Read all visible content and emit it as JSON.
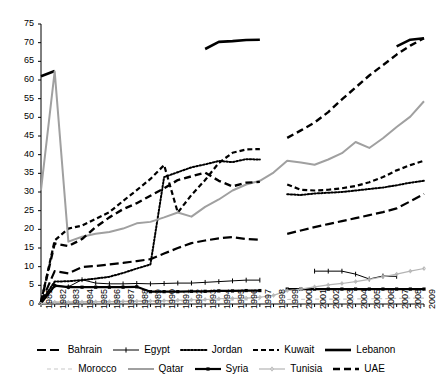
{
  "chart_data": {
    "type": "line",
    "title": "",
    "xlabel": "",
    "ylabel": "",
    "ylim": [
      0,
      75
    ],
    "ytick_step": 5,
    "yticks": [
      0,
      5,
      10,
      15,
      20,
      25,
      30,
      35,
      40,
      45,
      50,
      55,
      60,
      65,
      70,
      75
    ],
    "grid": false,
    "legend_position": "bottom",
    "x": [
      1981,
      1982,
      1983,
      1984,
      1985,
      1986,
      1987,
      1988,
      1989,
      1990,
      1991,
      1992,
      1993,
      1994,
      1995,
      1996,
      1997,
      1998,
      1999,
      2000,
      2001,
      2002,
      2003,
      2004,
      2005,
      2006,
      2007,
      2008,
      2009
    ],
    "categories": [
      "1981",
      "1982",
      "1983",
      "1984",
      "1985",
      "1986",
      "1987",
      "1988",
      "1989",
      "1990",
      "1991",
      "1992",
      "1993",
      "1994",
      "1995",
      "1996",
      "1997",
      "1998",
      "1999",
      "2000",
      "2001",
      "2002",
      "2003",
      "2004",
      "2005",
      "2006",
      "2007",
      "2008",
      "2009"
    ],
    "series": [
      {
        "name": "Bahrain",
        "color": "#000000",
        "style": "dashed-long",
        "width": 2.2,
        "values": [
          0.4,
          8.8,
          8.2,
          9.9,
          10.2,
          10.6,
          11.0,
          11.5,
          12.0,
          13.5,
          15.0,
          16.3,
          17.0,
          17.6,
          17.9,
          17.4,
          17.2,
          null,
          18.8,
          19.7,
          20.6,
          21.4,
          22.2,
          23.0,
          23.8,
          24.6,
          25.6,
          27.5,
          29.5
        ]
      },
      {
        "name": "Egypt",
        "color": "#000000",
        "style": "thin-marker",
        "width": 1.0,
        "values": [
          0.3,
          4.9,
          4.6,
          6.5,
          5.6,
          5.4,
          5.4,
          5.5,
          5.4,
          5.5,
          5.6,
          5.6,
          5.8,
          6.0,
          6.2,
          6.4,
          6.4,
          null,
          null,
          null,
          8.8,
          8.8,
          8.8,
          8.0,
          6.7,
          7.5,
          7.4,
          null,
          null
        ]
      },
      {
        "name": "Jordan",
        "color": "#000000",
        "style": "dotted",
        "width": 2.0,
        "values": [
          0.5,
          6.0,
          6.1,
          6.4,
          6.8,
          7.3,
          8.3,
          9.5,
          10.6,
          34.0,
          35.3,
          36.6,
          37.4,
          38.3,
          38.0,
          38.8,
          38.7,
          null,
          29.4,
          29.2,
          29.6,
          29.8,
          30.0,
          30.4,
          30.8,
          31.2,
          31.8,
          32.5,
          33.0
        ]
      },
      {
        "name": "Kuwait",
        "color": "#000000",
        "style": "dashed-short",
        "width": 2.2,
        "values": [
          0.5,
          17.0,
          20.2,
          21.0,
          22.8,
          24.6,
          27.6,
          30.5,
          33.5,
          37.2,
          24.5,
          29.2,
          33.2,
          37.8,
          40.5,
          41.4,
          41.5,
          null,
          32.0,
          30.6,
          30.4,
          30.6,
          31.0,
          31.6,
          32.6,
          34.0,
          35.8,
          37.2,
          38.4
        ]
      },
      {
        "name": "Lebanon",
        "color": "#000000",
        "style": "solid-thick",
        "width": 2.6,
        "values": [
          61.0,
          62.4,
          null,
          null,
          null,
          null,
          null,
          null,
          null,
          null,
          null,
          null,
          68.3,
          70.2,
          70.4,
          70.7,
          70.8,
          null,
          null,
          null,
          null,
          null,
          null,
          null,
          null,
          null,
          69.0,
          70.8,
          71.2
        ]
      },
      {
        "name": "Morocco",
        "color": "#c8c8c8",
        "style": "dashed-light",
        "width": 1.2,
        "values": [
          0.15,
          0.5,
          0.5,
          0.55,
          0.6,
          0.6,
          0.65,
          0.7,
          0.7,
          0.8,
          0.85,
          0.9,
          0.95,
          1.0,
          1.05,
          1.1,
          1.15,
          null,
          1.2,
          1.25,
          1.3,
          1.3,
          1.3,
          1.35,
          1.4,
          1.45,
          1.5,
          1.55,
          1.6
        ]
      },
      {
        "name": "Qatar",
        "color": "#a0a0a0",
        "style": "solid-gray",
        "width": 2.0,
        "values": [
          30.5,
          62.3,
          16.7,
          18.0,
          18.8,
          19.3,
          20.2,
          21.6,
          22.0,
          23.2,
          24.5,
          23.4,
          26.0,
          28.0,
          30.4,
          32.0,
          33.0,
          35.2,
          38.4,
          37.9,
          37.3,
          38.7,
          40.4,
          43.4,
          41.8,
          44.4,
          47.4,
          50.2,
          54.3
        ]
      },
      {
        "name": "Syria",
        "color": "#000000",
        "style": "solid-sqmarker",
        "width": 2.2,
        "values": [
          0.2,
          4.9,
          4.5,
          4.5,
          4.5,
          4.5,
          4.5,
          4.6,
          3.3,
          3.3,
          3.3,
          3.4,
          3.4,
          3.5,
          3.5,
          3.6,
          3.6,
          null,
          4.0,
          4.0,
          4.0,
          4.0,
          4.0,
          4.0,
          4.0,
          4.0,
          4.0,
          4.0,
          4.0
        ]
      },
      {
        "name": "Tunisia",
        "color": "#b4b4b4",
        "style": "light-marker",
        "width": 1.2,
        "values": [
          0.1,
          0.5,
          0.5,
          0.55,
          0.6,
          0.65,
          0.7,
          0.75,
          0.8,
          0.9,
          1.0,
          1.1,
          1.2,
          1.4,
          1.5,
          1.6,
          1.8,
          2.3,
          3.6,
          4.0,
          4.6,
          5.1,
          5.5,
          6.0,
          6.6,
          7.3,
          8.0,
          8.8,
          9.5
        ]
      },
      {
        "name": "UAE",
        "color": "#000000",
        "style": "dashed-med",
        "width": 2.4,
        "values": [
          0.5,
          16.2,
          15.5,
          17.4,
          20.6,
          23.2,
          25.4,
          27.0,
          29.0,
          31.0,
          33.2,
          34.2,
          35.2,
          33.0,
          31.5,
          32.5,
          32.7,
          null,
          44.5,
          46.5,
          48.6,
          51.4,
          54.8,
          58.0,
          61.2,
          64.0,
          66.8,
          69.2,
          71.2
        ]
      }
    ]
  },
  "axis": {
    "y_labels": [
      "75",
      "70",
      "65",
      "60",
      "55",
      "50",
      "45",
      "40",
      "35",
      "30",
      "25",
      "20",
      "15",
      "10",
      "5",
      "0"
    ],
    "x_labels": [
      "1981",
      "1982",
      "1983",
      "1984",
      "1985",
      "1986",
      "1987",
      "1988",
      "1989",
      "1990",
      "1991",
      "1992",
      "1993",
      "1994",
      "1995",
      "1996",
      "1997",
      "1998",
      "1999",
      "2000",
      "2001",
      "2002",
      "2003",
      "2004",
      "2005",
      "2006",
      "2007",
      "2008",
      "2009"
    ]
  },
  "legend": {
    "row1": [
      {
        "label": "Bahrain",
        "series": "Bahrain"
      },
      {
        "label": "Egypt",
        "series": "Egypt"
      },
      {
        "label": "Jordan",
        "series": "Jordan"
      },
      {
        "label": "Kuwait",
        "series": "Kuwait"
      },
      {
        "label": "Lebanon",
        "series": "Lebanon"
      }
    ],
    "row2": [
      {
        "label": "Morocco",
        "series": "Morocco"
      },
      {
        "label": "Qatar",
        "series": "Qatar"
      },
      {
        "label": "Syria",
        "series": "Syria"
      },
      {
        "label": "Tunisia",
        "series": "Tunisia"
      },
      {
        "label": "UAE",
        "series": "UAE"
      }
    ]
  }
}
